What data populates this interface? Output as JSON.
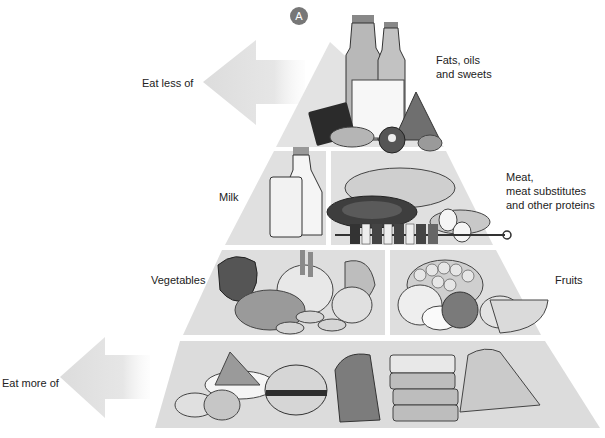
{
  "figure": {
    "badge": "A",
    "arrows": {
      "top": {
        "label": "Eat less of"
      },
      "bottom": {
        "label": "Eat more of"
      }
    },
    "tiers": [
      {
        "level": 1,
        "groups": [
          {
            "label": "Fats, oils\nand sweets",
            "items": [
              "oil bottles",
              "butter block",
              "chocolate bar",
              "peanuts",
              "donut",
              "gingerbread tree",
              "hazelnut"
            ]
          }
        ]
      },
      {
        "level": 2,
        "groups": [
          {
            "label": "Milk",
            "items": [
              "milk bottle",
              "glass of milk"
            ]
          },
          {
            "label": "Meat,\nmeat substitutes\nand other proteins",
            "items": [
              "roast chicken",
              "steak",
              "eggs",
              "fish fillet",
              "kebab skewer"
            ]
          }
        ]
      },
      {
        "level": 3,
        "groups": [
          {
            "label": "Vegetables",
            "items": [
              "leafy greens",
              "fennel",
              "cabbage",
              "onion",
              "sliced zucchini",
              "grated carrot"
            ]
          },
          {
            "label": "Fruits",
            "items": [
              "grapes",
              "apples",
              "melon slice",
              "lemon"
            ]
          }
        ]
      },
      {
        "level": 4,
        "groups": [
          {
            "label": "",
            "items": [
              "potatoes",
              "flour",
              "bun",
              "bread loaf",
              "sliced bread",
              "rice"
            ]
          }
        ]
      }
    ]
  }
}
